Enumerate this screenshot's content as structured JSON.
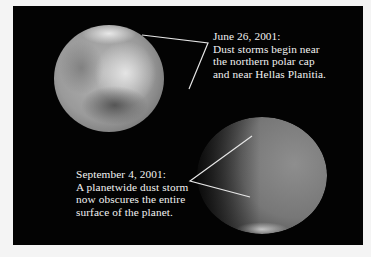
{
  "figure": {
    "background_color": "#030303",
    "page_color": "#f4f4f4",
    "images": [
      {
        "name": "mars-before-storm",
        "description": "Mars with localized dust storms"
      },
      {
        "name": "mars-global-storm",
        "description": "Mars obscured by planetwide dust storm"
      }
    ],
    "captions": [
      {
        "date": "June 26, 2001:",
        "lines": [
          "Dust storms begin near",
          "the northern polar cap",
          "and near Hellas Planitia."
        ]
      },
      {
        "date": "September 4, 2001:",
        "lines": [
          "A planetwide dust storm",
          "now obscures the entire",
          "surface of the planet."
        ]
      }
    ],
    "annotation_line_color": "#e8e8e8"
  }
}
